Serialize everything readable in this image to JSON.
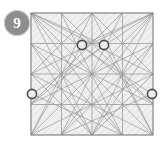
{
  "badge": {
    "label": "9",
    "icon": "step-number-badge",
    "fill": "#8e8e8e",
    "text_color": "#ffffff"
  },
  "figure": {
    "title": "",
    "type": "geometric-construction",
    "shape": "square",
    "square": {
      "x": 31,
      "y": 13,
      "width": 122,
      "height": 122
    },
    "colors": {
      "border": "#7a7a7a",
      "fill": "#f0f0f0",
      "hatch": "#c9c9c9",
      "grid": "#9a9a9a",
      "construction": "#8c8c8c",
      "marker_stroke": "#4a4a4a",
      "marker_fill": "#ededed",
      "background": "#ffffff"
    },
    "hatch": {
      "angle_deg": 45,
      "spacing": 5,
      "width": 0.7
    },
    "grid": {
      "rows": 4,
      "cols": 4,
      "width": 0.8
    },
    "markers": [
      {
        "name": "vertex-marker-top-left",
        "x": 82,
        "y": 45,
        "r": 4.6
      },
      {
        "name": "vertex-marker-top-right",
        "x": 104,
        "y": 45,
        "r": 4.6
      },
      {
        "name": "vertex-marker-left-edge",
        "x": 32,
        "y": 94,
        "r": 4.6
      },
      {
        "name": "vertex-marker-right-edge",
        "x": 152,
        "y": 94,
        "r": 4.6
      }
    ],
    "construction_lines": [
      [
        31,
        13,
        153,
        135
      ],
      [
        153,
        13,
        31,
        135
      ],
      [
        31,
        13,
        92,
        135
      ],
      [
        153,
        13,
        92,
        135
      ],
      [
        92,
        13,
        31,
        135
      ],
      [
        92,
        13,
        153,
        135
      ],
      [
        31,
        13,
        153,
        74
      ],
      [
        31,
        135,
        153,
        74
      ],
      [
        153,
        13,
        31,
        74
      ],
      [
        153,
        135,
        31,
        74
      ],
      [
        31,
        44,
        153,
        104
      ],
      [
        31,
        104,
        153,
        44
      ],
      [
        61,
        13,
        153,
        104
      ],
      [
        122,
        13,
        31,
        104
      ],
      [
        61,
        135,
        153,
        44
      ],
      [
        122,
        135,
        31,
        44
      ],
      [
        31,
        13,
        122,
        135
      ],
      [
        153,
        13,
        61,
        135
      ],
      [
        31,
        74,
        92,
        13
      ],
      [
        153,
        74,
        92,
        13
      ],
      [
        31,
        74,
        92,
        135
      ],
      [
        153,
        74,
        92,
        135
      ],
      [
        61,
        13,
        122,
        135
      ],
      [
        122,
        13,
        61,
        135
      ],
      [
        31,
        44,
        92,
        135
      ],
      [
        153,
        44,
        92,
        135
      ],
      [
        82,
        45,
        31,
        135
      ],
      [
        104,
        45,
        153,
        135
      ],
      [
        82,
        45,
        153,
        104
      ],
      [
        104,
        45,
        31,
        104
      ],
      [
        82,
        45,
        153,
        13
      ],
      [
        104,
        45,
        31,
        13
      ],
      [
        32,
        94,
        153,
        13
      ],
      [
        152,
        94,
        31,
        13
      ],
      [
        32,
        94,
        122,
        135
      ],
      [
        152,
        94,
        61,
        135
      ]
    ]
  }
}
